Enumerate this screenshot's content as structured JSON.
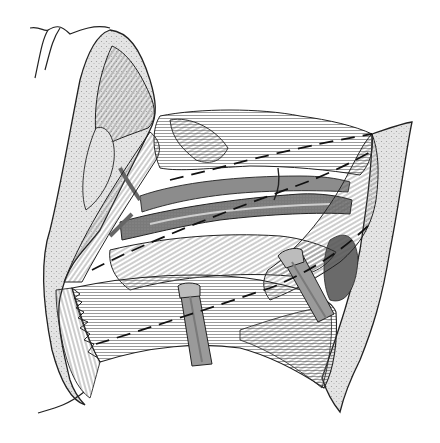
{
  "figure": {
    "kind": "grayscale anatomical line illustration",
    "text_labels": [],
    "colors": {
      "background": "#ffffff",
      "outline": "#222222",
      "skin_fill": "#e6e6e6",
      "muscle_fill": "#f2f2f2",
      "fiber_stroke": "#555555",
      "vessel_dark": "#6e6e6e",
      "vessel_mid": "#8c8c8c",
      "retractor_fill": "#9a9a9a",
      "retractor_dark": "#707070"
    },
    "elements": {
      "skin_flap_left": "upper-left skin flap with cut edge",
      "skin_flap_right": "right skin edge",
      "muscle_upper_band": "upper muscle belly",
      "muscle_lower_band": "lower muscle belly with torn/cut edge",
      "vessels": "large central vessel with branches",
      "retractor_center": "central retractor",
      "retractor_right": "right oblique retractor",
      "incision_lines": "dashed incision lines crossing the muscles"
    }
  }
}
